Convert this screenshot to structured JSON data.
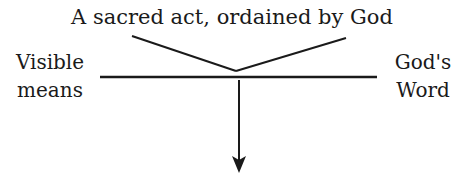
{
  "diagram": {
    "title": "A sacred act, ordained by God",
    "left_label": {
      "line1": "Visible",
      "line2": "means"
    },
    "right_label": {
      "line1": "God's",
      "line2": "Word"
    },
    "colors": {
      "ink": "#1a1a1a",
      "background": "#ffffff"
    }
  }
}
